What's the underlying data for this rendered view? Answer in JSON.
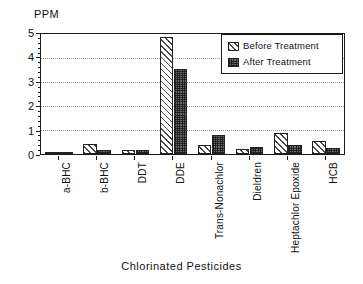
{
  "chart_data": {
    "type": "bar",
    "title": "",
    "xlabel": "Chlorinated Pesticides",
    "ylabel": "PPM",
    "ylim": [
      0,
      5
    ],
    "yticks": [
      0,
      1,
      2,
      3,
      4,
      5
    ],
    "ytick_labels": [
      "0",
      "1",
      "2",
      "3",
      "4",
      "5"
    ],
    "grid": true,
    "grid_axis": "y",
    "legend_position": "top-right",
    "categories": [
      "a-BHC",
      "b-BHC",
      "DDT",
      "DDE",
      "Trans-Nonachlor",
      "Dieldren",
      "Heptachlor Epoxide",
      "HCB"
    ],
    "series": [
      {
        "name": "Before Treatment",
        "pattern": "diagonal-hatch",
        "color": "#ffffff",
        "values": [
          0.1,
          0.43,
          0.16,
          4.8,
          0.38,
          0.22,
          0.87,
          0.55
        ]
      },
      {
        "name": "After Treatment",
        "pattern": "cross-hatch-dark",
        "color": "#6e6e6e",
        "values": [
          0.03,
          0.17,
          0.17,
          3.5,
          0.78,
          0.27,
          0.38,
          0.25
        ]
      }
    ]
  },
  "legend": {
    "entries": [
      {
        "label": "Before Treatment"
      },
      {
        "label": "After Treatment"
      }
    ]
  },
  "axes": {
    "y_title": "PPM",
    "x_title": "Chlorinated Pesticides"
  }
}
